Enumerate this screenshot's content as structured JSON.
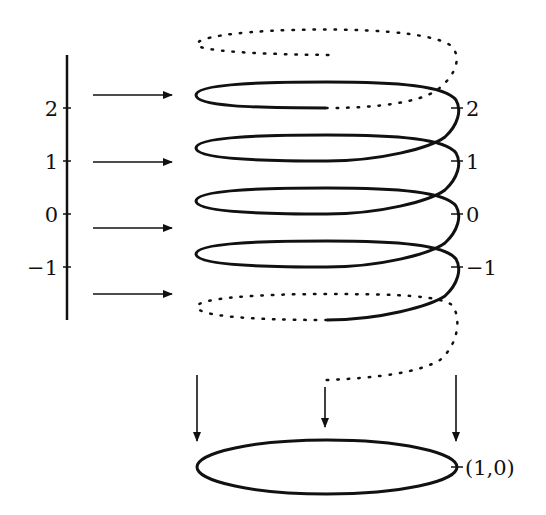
{
  "diagram": {
    "title": "",
    "colors": {
      "stroke": "#111111",
      "background": "#ffffff"
    },
    "left_axis": {
      "ticks": [
        {
          "label": "2",
          "y": 108
        },
        {
          "label": "1",
          "y": 161
        },
        {
          "label": "0",
          "y": 214
        },
        {
          "label": "−1",
          "y": 267
        }
      ]
    },
    "helix_ticks": [
      {
        "label": "2",
        "y": 108
      },
      {
        "label": "1",
        "y": 161
      },
      {
        "label": "0",
        "y": 214
      },
      {
        "label": "−1",
        "y": 267
      }
    ],
    "horizontal_arrows": [
      95,
      162,
      228,
      294
    ],
    "down_arrows": [
      {
        "x": 197,
        "y1": 375,
        "y2": 440
      },
      {
        "x": 325,
        "y1": 385,
        "y2": 425
      },
      {
        "x": 456,
        "y1": 375,
        "y2": 440
      }
    ],
    "circle": {
      "label": "(1,0)"
    }
  }
}
